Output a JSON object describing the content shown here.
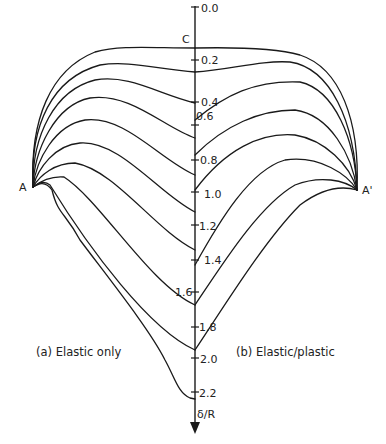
{
  "diagram": {
    "axis_label_top": "C",
    "axis_label_bottom": "δ/R",
    "point_left": "A",
    "point_right": "A'",
    "caption_left": "(a) Elastic only",
    "caption_right": "(b) Elastic/plastic",
    "ticks": [
      {
        "label": "0.0",
        "y": 8
      },
      {
        "label": "0.2",
        "y": 60
      },
      {
        "label": "0.4",
        "y": 102
      },
      {
        "label": "0.6",
        "y": 125
      },
      {
        "label": "0.8",
        "y": 160
      },
      {
        "label": "1.0",
        "y": 192
      },
      {
        "label": "1.2",
        "y": 225
      },
      {
        "label": "1.4",
        "y": 260
      },
      {
        "label": "1.6",
        "y": 292
      },
      {
        "label": "1.8",
        "y": 327
      },
      {
        "label": "2.0",
        "y": 358
      },
      {
        "label": "2.2",
        "y": 392
      }
    ],
    "colors": {
      "line": "#1a1a1a",
      "background": "#ffffff"
    }
  }
}
